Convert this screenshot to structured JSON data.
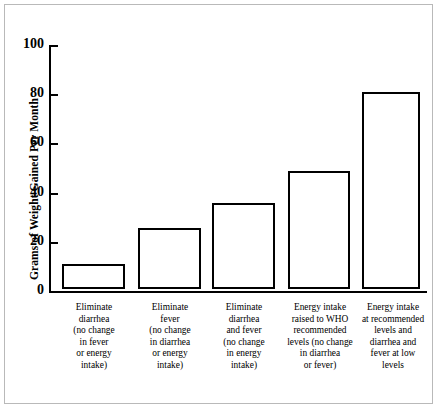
{
  "chart_data": {
    "type": "bar",
    "title": "",
    "xlabel": "",
    "ylabel": "Grams of Weight Gained Per Month",
    "ylim": [
      0,
      100
    ],
    "yticks": [
      0,
      20,
      40,
      60,
      80,
      100
    ],
    "grid": false,
    "legend": null,
    "categories": [
      "Eliminate diarrhea (no change in fever or energy intake)",
      "Eliminate fever (no change in diarrhea or energy intake)",
      "Eliminate diarrhea and fever (no change in energy intake)",
      "Energy intake raised to WHO recommended levels (no change in diarrhea or fever)",
      "Energy intake at recommended levels and diarrhea and fever at low levels"
    ],
    "category_lines": [
      [
        "Eliminate",
        "diarrhea",
        "(no change",
        "in fever",
        "or energy",
        "intake)"
      ],
      [
        "Eliminate",
        "fever",
        "(no change",
        "in diarrhea",
        "or energy",
        "intake)"
      ],
      [
        "Eliminate",
        "diarrhea",
        "and fever",
        "(no change",
        "in energy",
        "intake)"
      ],
      [
        "Energy intake",
        "raised to WHO",
        "recommended",
        "levels (no change",
        "in diarrhea",
        "or fever)"
      ],
      [
        "Energy intake",
        "at recommended",
        "levels and",
        "diarrhea and",
        "fever at low",
        "levels"
      ]
    ],
    "values": [
      10,
      25,
      35,
      48,
      80
    ]
  },
  "style": {
    "bar_fill": "#ffffff",
    "bar_stroke": "#000000",
    "axis_color": "#000000",
    "frame_color": "#b9b9b9",
    "background": "#ffffff"
  }
}
